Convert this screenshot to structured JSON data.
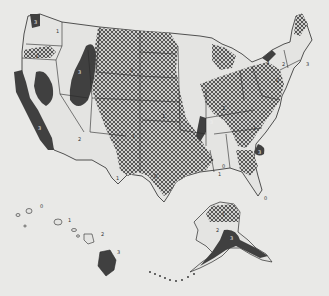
{
  "map": {
    "subject": "Seismic risk zones of the United States",
    "colors": {
      "background": "#e9e9e7",
      "zone0": "#e6e6e4",
      "zone1": "#dcdcda",
      "zone2_hatch": "#555555",
      "zone3": "#3c3c3c",
      "border": "#2a2a2a"
    },
    "legend_zones": [
      "0",
      "1",
      "2",
      "3"
    ],
    "labels": {
      "wa": "3",
      "wa_east": "1",
      "or": "2",
      "ca": "3",
      "nv": "3",
      "id_mt": "3",
      "az": "2",
      "mt": "2",
      "ut": "2",
      "co": "1",
      "mid": "1",
      "tx": "0",
      "tx_w": "1",
      "nmad": "3",
      "ohio": "2",
      "va": "1",
      "sc": "3",
      "fl": "0",
      "al": "0",
      "al2": "1",
      "ne1": "3",
      "ne2": "2",
      "ne3": "3",
      "ny": "2",
      "hi_w": "0",
      "hi_1": "1",
      "hi_2": "2",
      "hi_3": "3",
      "ak_n": "1",
      "ak_w": "2",
      "ak_s": "3"
    }
  }
}
